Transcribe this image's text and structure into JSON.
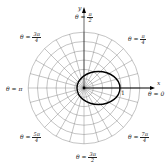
{
  "chart_data": {
    "type": "line",
    "subtype": "polar",
    "title": "",
    "xlabel": "x",
    "ylabel": "y",
    "curve": {
      "description": "closed conic (ellipse) with focus at the pole, extending mostly along the positive x-axis",
      "center_offset_x": 0.39,
      "semi_major": 0.58,
      "semi_minor": 0.46
    },
    "radial_ticks": [
      "1/3",
      "2/3",
      "1"
    ],
    "angle_labels": [
      {
        "num": "π",
        "den": "2",
        "prefix": "θ = ",
        "position": "top"
      },
      {
        "num": "π",
        "den": "4",
        "prefix": "θ = ",
        "position": "top-right"
      },
      {
        "text": "θ = 0",
        "position": "right"
      },
      {
        "num": "7π",
        "den": "4",
        "prefix": "θ = ",
        "position": "bottom-right"
      },
      {
        "num": "3π",
        "den": "2",
        "prefix": "θ = ",
        "position": "bottom"
      },
      {
        "num": "5π",
        "den": "4",
        "prefix": "θ = ",
        "position": "bottom-left"
      },
      {
        "text": "θ = π",
        "position": "left"
      },
      {
        "num": "3π",
        "den": "4",
        "prefix": "θ = ",
        "position": "top-left"
      }
    ],
    "grid": {
      "rings": 6,
      "spoke_step_deg": 15
    }
  },
  "labels": {
    "top_prefix": "θ = ",
    "top_num": "π",
    "top_den": "2",
    "tr_prefix": "θ = ",
    "tr_num": "π",
    "tr_den": "4",
    "right": "θ = 0",
    "br_prefix": "θ = ",
    "br_num": "7π",
    "br_den": "4",
    "bottom_prefix": "θ = ",
    "bottom_num": "3π",
    "bottom_den": "2",
    "bl_prefix": "θ = ",
    "bl_num": "5π",
    "bl_den": "4",
    "left": "θ = π",
    "tl_prefix": "θ = ",
    "tl_num": "3π",
    "tl_den": "4",
    "x_axis": "x",
    "y_axis": "y",
    "tick_one": "1"
  }
}
